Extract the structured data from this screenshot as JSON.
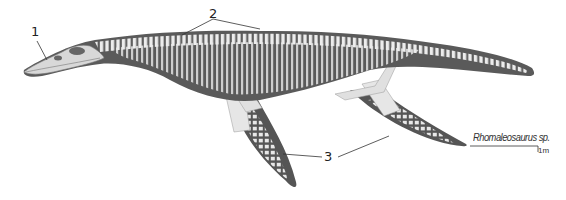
{
  "diagram": {
    "species_label": "Rhomaleosaurus sp.",
    "scale_label": "1m",
    "callouts": [
      {
        "id": "1",
        "label": "1",
        "target": "skull"
      },
      {
        "id": "2",
        "label": "2",
        "target": "vertebral column / ribs"
      },
      {
        "id": "3",
        "label": "3",
        "target": "flippers (fore and hind)"
      }
    ],
    "colors": {
      "body": "#5a5a5a",
      "bone": "#e6e6e6",
      "line": "#333333",
      "background": "#ffffff"
    }
  }
}
